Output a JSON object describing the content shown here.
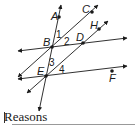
{
  "diagram": {
    "points": [
      {
        "name": "A",
        "x": 59,
        "y": 17,
        "lx": 51,
        "ly": 20
      },
      {
        "name": "B",
        "x": 52,
        "y": 47,
        "lx": 43,
        "ly": 46
      },
      {
        "name": "C",
        "x": 92,
        "y": 12,
        "lx": 82,
        "ly": 13
      },
      {
        "name": "D",
        "x": 83,
        "y": 43,
        "lx": 76,
        "ly": 41
      },
      {
        "name": "H",
        "x": 99,
        "y": 29,
        "lx": 90,
        "ly": 29
      },
      {
        "name": "E",
        "x": 46,
        "y": 76,
        "lx": 37,
        "ly": 75
      },
      {
        "name": "F",
        "x": 112,
        "y": 71,
        "lx": 109,
        "ly": 82
      }
    ],
    "angles": [
      {
        "label": "1",
        "x": 56,
        "y": 38
      },
      {
        "label": "2",
        "x": 64,
        "y": 45
      },
      {
        "label": "3",
        "x": 49,
        "y": 66
      },
      {
        "label": "4",
        "x": 59,
        "y": 73
      }
    ],
    "lines": [
      {
        "name": "line-AE",
        "x1": 61,
        "y1": 5,
        "x2": 39,
        "y2": 111
      },
      {
        "name": "line-BD",
        "x1": 18,
        "y1": 51,
        "x2": 127,
        "y2": 38
      },
      {
        "name": "line-EF",
        "x1": 18,
        "y1": 79,
        "x2": 127,
        "y2": 66
      },
      {
        "name": "line-BC",
        "x1": 18,
        "y1": 77,
        "x2": 98,
        "y2": 5
      },
      {
        "name": "line-EH",
        "x1": 27,
        "y1": 93,
        "x2": 108,
        "y2": 21
      }
    ]
  },
  "footer": {
    "reasons_label": "Reasons"
  }
}
